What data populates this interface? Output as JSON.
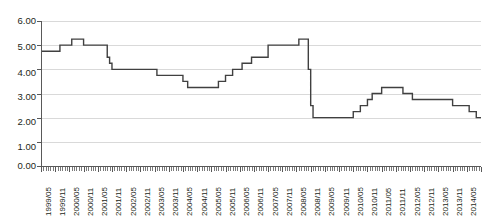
{
  "chart_data": {
    "type": "line",
    "title": "",
    "subtitle": "",
    "xlabel": "",
    "ylabel": "",
    "ylim": [
      0.0,
      6.0
    ],
    "yticks": [
      "0.00",
      "1.00",
      "2.00",
      "3.00",
      "4.00",
      "5.00",
      "6.00"
    ],
    "ytick_values": [
      0.0,
      1.0,
      2.0,
      3.0,
      4.0,
      5.0,
      6.0
    ],
    "grid": true,
    "legend": "none",
    "line_color": "#404040",
    "grid_color": "#d9d9d9",
    "axis_color": "#595959",
    "step_style": "post",
    "x_tick_interval": "monthly",
    "x_label_interval": "semiannual",
    "xtick_labels": [
      "1999/05",
      "1999/11",
      "2000/05",
      "2000/11",
      "2001/05",
      "2001/11",
      "2002/05",
      "2002/11",
      "2003/05",
      "2003/11",
      "2004/05",
      "2004/11",
      "2005/05",
      "2005/11",
      "2006/05",
      "2006/11",
      "2007/05",
      "2007/11",
      "2008/05",
      "2008/11",
      "2009/05",
      "2009/11",
      "2010/05",
      "2010/11",
      "2011/05",
      "2011/11",
      "2012/05",
      "2012/11",
      "2013/05",
      "2013/11",
      "2014/05",
      "2014/11"
    ],
    "x": [
      "1999/05",
      "1999/06",
      "1999/07",
      "1999/08",
      "1999/09",
      "1999/10",
      "1999/11",
      "1999/12",
      "2000/01",
      "2000/02",
      "2000/03",
      "2000/04",
      "2000/05",
      "2000/06",
      "2000/07",
      "2000/08",
      "2000/09",
      "2000/10",
      "2000/11",
      "2000/12",
      "2001/01",
      "2001/02",
      "2001/03",
      "2001/04",
      "2001/05",
      "2001/06",
      "2001/07",
      "2001/08",
      "2001/09",
      "2001/10",
      "2001/11",
      "2001/12",
      "2002/01",
      "2002/02",
      "2002/03",
      "2002/04",
      "2002/05",
      "2002/06",
      "2002/07",
      "2002/08",
      "2002/09",
      "2002/10",
      "2002/11",
      "2002/12",
      "2003/01",
      "2003/02",
      "2003/03",
      "2003/04",
      "2003/05",
      "2003/06",
      "2003/07",
      "2003/08",
      "2003/09",
      "2003/10",
      "2003/11",
      "2003/12",
      "2004/01",
      "2004/02",
      "2004/03",
      "2004/04",
      "2004/05",
      "2004/06",
      "2004/07",
      "2004/08",
      "2004/09",
      "2004/10",
      "2004/11",
      "2004/12",
      "2005/01",
      "2005/02",
      "2005/03",
      "2005/04",
      "2005/05",
      "2005/06",
      "2005/07",
      "2005/08",
      "2005/09",
      "2005/10",
      "2005/11",
      "2005/12",
      "2006/01",
      "2006/02",
      "2006/03",
      "2006/04",
      "2006/05",
      "2006/06",
      "2006/07",
      "2006/08",
      "2006/09",
      "2006/10",
      "2006/11",
      "2006/12",
      "2007/01",
      "2007/02",
      "2007/03",
      "2007/04",
      "2007/05",
      "2007/06",
      "2007/07",
      "2007/08",
      "2007/09",
      "2007/10",
      "2007/11",
      "2007/12",
      "2008/01",
      "2008/02",
      "2008/03",
      "2008/04",
      "2008/05",
      "2008/06",
      "2008/07",
      "2008/08",
      "2008/09",
      "2008/10",
      "2008/11",
      "2008/12",
      "2009/01",
      "2009/02",
      "2009/03",
      "2009/04",
      "2009/05",
      "2009/06",
      "2009/07",
      "2009/08",
      "2009/09",
      "2009/10",
      "2009/11",
      "2009/12",
      "2010/01",
      "2010/02",
      "2010/03",
      "2010/04",
      "2010/05",
      "2010/06",
      "2010/07",
      "2010/08",
      "2010/09",
      "2010/10",
      "2010/11",
      "2010/12",
      "2011/01",
      "2011/02",
      "2011/03",
      "2011/04",
      "2011/05",
      "2011/06",
      "2011/07",
      "2011/08",
      "2011/09",
      "2011/10",
      "2011/11",
      "2011/12",
      "2012/01",
      "2012/02",
      "2012/03",
      "2012/04",
      "2012/05",
      "2012/06",
      "2012/07",
      "2012/08",
      "2012/09",
      "2012/10",
      "2012/11",
      "2012/12",
      "2013/01",
      "2013/02",
      "2013/03",
      "2013/04",
      "2013/05",
      "2013/06",
      "2013/07",
      "2013/08",
      "2013/09",
      "2013/10",
      "2013/11",
      "2013/12",
      "2014/01",
      "2014/02",
      "2014/03",
      "2014/04",
      "2014/05",
      "2014/06",
      "2014/07",
      "2014/08",
      "2014/09",
      "2014/10",
      "2014/11"
    ],
    "values": [
      4.75,
      4.75,
      4.75,
      4.75,
      4.75,
      4.75,
      4.75,
      4.75,
      5.0,
      5.0,
      5.0,
      5.0,
      5.0,
      5.25,
      5.25,
      5.25,
      5.25,
      5.25,
      5.0,
      5.0,
      5.0,
      5.0,
      5.0,
      5.0,
      5.0,
      5.0,
      5.0,
      5.0,
      4.5,
      4.25,
      4.0,
      4.0,
      4.0,
      4.0,
      4.0,
      4.0,
      4.0,
      4.0,
      4.0,
      4.0,
      4.0,
      4.0,
      4.0,
      4.0,
      4.0,
      4.0,
      4.0,
      4.0,
      4.0,
      3.75,
      3.75,
      3.75,
      3.75,
      3.75,
      3.75,
      3.75,
      3.75,
      3.75,
      3.75,
      3.75,
      3.5,
      3.5,
      3.25,
      3.25,
      3.25,
      3.25,
      3.25,
      3.25,
      3.25,
      3.25,
      3.25,
      3.25,
      3.25,
      3.25,
      3.25,
      3.5,
      3.5,
      3.5,
      3.75,
      3.75,
      3.75,
      4.0,
      4.0,
      4.0,
      4.0,
      4.25,
      4.25,
      4.25,
      4.25,
      4.5,
      4.5,
      4.5,
      4.5,
      4.5,
      4.5,
      4.5,
      5.0,
      5.0,
      5.0,
      5.0,
      5.0,
      5.0,
      5.0,
      5.0,
      5.0,
      5.0,
      5.0,
      5.0,
      5.0,
      5.25,
      5.25,
      5.25,
      5.25,
      4.0,
      2.5,
      2.0,
      2.0,
      2.0,
      2.0,
      2.0,
      2.0,
      2.0,
      2.0,
      2.0,
      2.0,
      2.0,
      2.0,
      2.0,
      2.0,
      2.0,
      2.0,
      2.0,
      2.25,
      2.25,
      2.25,
      2.5,
      2.5,
      2.5,
      2.75,
      2.75,
      3.0,
      3.0,
      3.0,
      3.0,
      3.25,
      3.25,
      3.25,
      3.25,
      3.25,
      3.25,
      3.25,
      3.25,
      3.25,
      3.0,
      3.0,
      3.0,
      3.0,
      2.75,
      2.75,
      2.75,
      2.75,
      2.75,
      2.75,
      2.75,
      2.75,
      2.75,
      2.75,
      2.75,
      2.75,
      2.75,
      2.75,
      2.75,
      2.75,
      2.75,
      2.5,
      2.5,
      2.5,
      2.5,
      2.5,
      2.5,
      2.5,
      2.25,
      2.25,
      2.25,
      2.0,
      2.0,
      2.0
    ]
  }
}
